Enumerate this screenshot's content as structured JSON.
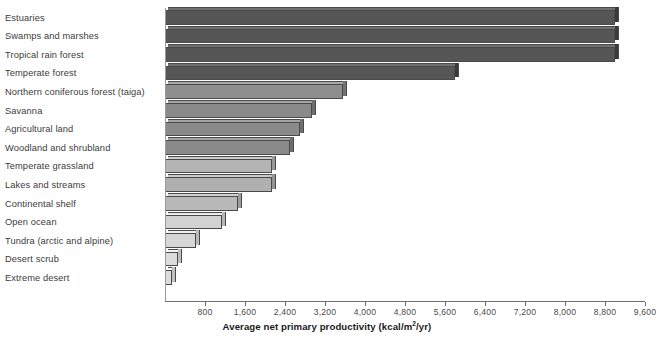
{
  "chart_data": {
    "type": "bar",
    "orientation": "horizontal",
    "title": "",
    "xlabel": "Average net primary productivity (kcal/m2/yr)",
    "ylabel": "",
    "xlim": [
      0,
      9600
    ],
    "xtick_step": 800,
    "grid": false,
    "legend": null,
    "xticks": [
      "800",
      "1,600",
      "2,400",
      "3,200",
      "4,000",
      "4,800",
      "5,600",
      "6,400",
      "7,200",
      "8,000",
      "8,800",
      "9,600"
    ],
    "categories": [
      "Estuaries",
      "Swamps and marshes",
      "Tropical rain forest",
      "Temperate forest",
      "Northern coniferous forest (taiga)",
      "Savanna",
      "Agricultural land",
      "Woodland and shrubland",
      "Temperate grassland",
      "Lakes and streams",
      "Continental shelf",
      "Open ocean",
      "Tundra (arctic and alpine)",
      "Desert scrub",
      "Extreme desert"
    ],
    "values": [
      9000,
      9000,
      9000,
      5800,
      3550,
      2940,
      2700,
      2500,
      2140,
      2140,
      1460,
      1140,
      620,
      260,
      140
    ],
    "bar_colors": [
      "#565656",
      "#565656",
      "#565656",
      "#565656",
      "#8e8e8e",
      "#8a8a8a",
      "#8a8a8a",
      "#8a8a8a",
      "#b4b4b4",
      "#b0b0b0",
      "#b9b9b9",
      "#d2d2d2",
      "#d6d6d6",
      "#dcdcdc",
      "#dcdcdc"
    ]
  },
  "axis": {
    "title_main": "Average net primary productivity (kcal/m",
    "title_sup": "2",
    "title_tail": "/yr)"
  }
}
